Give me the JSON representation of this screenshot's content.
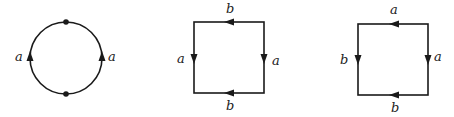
{
  "figures": [
    {
      "name": "circle-with-two-vertices",
      "shape": "circle",
      "center": [
        66,
        58
      ],
      "radius": 36,
      "vertices": [
        [
          66,
          22
        ],
        [
          66,
          94
        ]
      ],
      "edges": [
        {
          "side": "left",
          "label": "a",
          "arrow": "up"
        },
        {
          "side": "right",
          "label": "a",
          "arrow": "up"
        }
      ]
    },
    {
      "name": "square-torus",
      "shape": "square",
      "box": {
        "left": 194,
        "top": 22,
        "right": 264,
        "bottom": 93
      },
      "edges": [
        {
          "side": "top",
          "label": "b",
          "arrow": "left"
        },
        {
          "side": "bottom",
          "label": "b",
          "arrow": "left"
        },
        {
          "side": "left",
          "label": "a",
          "arrow": "down"
        },
        {
          "side": "right",
          "label": "a",
          "arrow": "down"
        }
      ]
    },
    {
      "name": "square-variant",
      "shape": "square",
      "box": {
        "left": 358,
        "top": 24,
        "right": 428,
        "bottom": 95
      },
      "edges": [
        {
          "side": "top",
          "label": "a",
          "arrow": "left"
        },
        {
          "side": "bottom",
          "label": "b",
          "arrow": "left"
        },
        {
          "side": "left",
          "label": "b",
          "arrow": "down"
        },
        {
          "side": "right",
          "label": "a",
          "arrow": "down"
        }
      ]
    }
  ]
}
